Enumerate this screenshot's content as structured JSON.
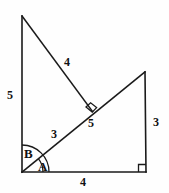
{
  "figure": {
    "stroke_color": "#1a1a1a",
    "background_color": "#fefefe",
    "points": {
      "top_apex": {
        "x": 22,
        "y": 16
      },
      "bottom_left": {
        "x": 22,
        "y": 172
      },
      "bottom_right": {
        "x": 146,
        "y": 172
      },
      "right_apex": {
        "x": 145,
        "y": 72
      },
      "foot_on_diagonal": {
        "x": 92,
        "y": 111
      }
    },
    "segments": [
      {
        "name": "left-vertical-side",
        "from": "top_apex",
        "to": "bottom_left",
        "length_label": "5"
      },
      {
        "name": "upper-diagonal-side",
        "from": "top_apex",
        "to": "foot_on_diagonal",
        "length_label": "4"
      },
      {
        "name": "long-diagonal-lower",
        "from": "bottom_left",
        "to": "foot_on_diagonal",
        "length_label": "3"
      },
      {
        "name": "long-diagonal-upper",
        "from": "foot_on_diagonal",
        "to": "right_apex",
        "length_label": "5"
      },
      {
        "name": "right-vertical-side",
        "from": "right_apex",
        "to": "bottom_right",
        "length_label": "3"
      },
      {
        "name": "bottom-horizontal-side",
        "from": "bottom_left",
        "to": "bottom_right",
        "length_label": "4"
      }
    ],
    "side_labels": [
      {
        "name": "label-left-side-5",
        "text": "5",
        "x": 7,
        "y": 89
      },
      {
        "name": "label-upper-diagonal-4",
        "text": "4",
        "x": 64,
        "y": 56
      },
      {
        "name": "label-lower-diagonal-3",
        "text": "3",
        "x": 51,
        "y": 128
      },
      {
        "name": "label-upper-diagonal-5",
        "text": "5",
        "x": 88,
        "y": 117
      },
      {
        "name": "label-right-side-3",
        "text": "3",
        "x": 153,
        "y": 116
      },
      {
        "name": "label-bottom-side-4",
        "text": "4",
        "x": 80,
        "y": 176
      }
    ],
    "angle_labels": [
      {
        "name": "angle-label-b",
        "text": "B",
        "x": 24,
        "y": 147
      },
      {
        "name": "angle-label-a",
        "text": "A",
        "x": 38,
        "y": 160
      }
    ],
    "right_angle_marks": [
      {
        "name": "right-angle-mark-middle",
        "at": "foot_on_diagonal"
      },
      {
        "name": "right-angle-mark-bottom-right",
        "at": "bottom_right"
      }
    ],
    "angle_arcs": [
      {
        "name": "angle-arc-b-outer",
        "vertex": "bottom_left",
        "radius": 27,
        "from_deg": 0,
        "to_deg": 90
      },
      {
        "name": "angle-arc-a-inner",
        "vertex": "bottom_left",
        "radius": 21,
        "from_deg": 0,
        "to_deg": 39
      }
    ]
  }
}
